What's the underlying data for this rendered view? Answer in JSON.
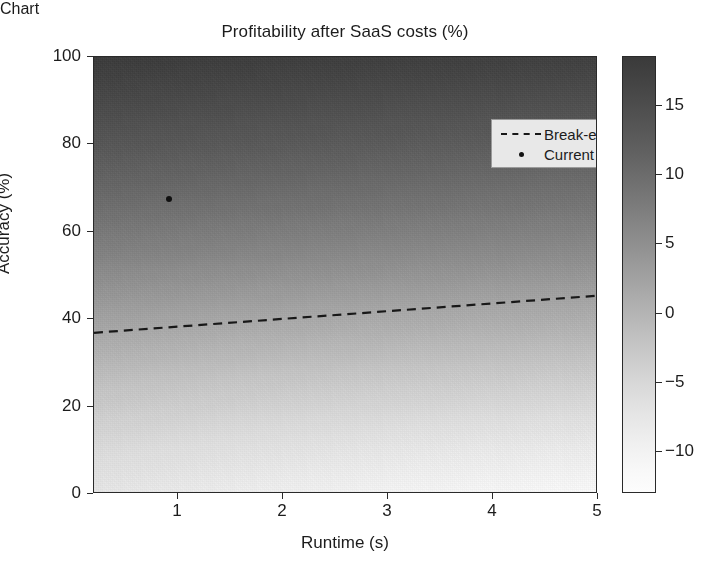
{
  "chart_data": {
    "type": "heatmap",
    "title": "Profitability after SaaS costs (%)",
    "xlabel": "Runtime (s)",
    "ylabel": "Accuracy (%)",
    "xlim": [
      0.2,
      5.0
    ],
    "ylim": [
      0,
      100
    ],
    "grid": false,
    "x_ticks": [
      {
        "value": 1,
        "label": "1"
      },
      {
        "value": 2,
        "label": "2"
      },
      {
        "value": 3,
        "label": "3"
      },
      {
        "value": 4,
        "label": "4"
      },
      {
        "value": 5,
        "label": "5"
      }
    ],
    "y_ticks": [
      {
        "value": 0,
        "label": "0"
      },
      {
        "value": 20,
        "label": "20"
      },
      {
        "value": 40,
        "label": "40"
      },
      {
        "value": 60,
        "label": "60"
      },
      {
        "value": 80,
        "label": "80"
      },
      {
        "value": 100,
        "label": "100"
      }
    ],
    "colorbar": {
      "label": "Profitability after SaaS costs (%)",
      "vmin": -13,
      "vmax": 18.5,
      "orientation": "vertical",
      "position": "right",
      "colormap": "greys_reversed",
      "ticks": [
        {
          "value": 15,
          "label": "15"
        },
        {
          "value": 10,
          "label": "10"
        },
        {
          "value": 5,
          "label": "5"
        },
        {
          "value": 0,
          "label": "0"
        },
        {
          "value": -5,
          "label": "−5"
        },
        {
          "value": -10,
          "label": "−10"
        }
      ]
    },
    "field": {
      "description": "Profitability increases with accuracy and decreases slightly with runtime",
      "corner_values": {
        "top_left": 17.5,
        "top_right": 16.0,
        "bottom_left": -12.0,
        "bottom_right": -13.0
      }
    },
    "series": [
      {
        "name": "Break-even",
        "type": "line",
        "style": "dashed",
        "color": "#181818",
        "x": [
          0.2,
          5.0
        ],
        "y": [
          36.6,
          45.1
        ]
      },
      {
        "name": "Current prototype",
        "type": "scatter",
        "style": "dot",
        "color": "#101010",
        "points": [
          {
            "x": 0.91,
            "y": 67.5
          }
        ]
      }
    ],
    "legend": {
      "position": "upper right",
      "entries": [
        {
          "label": "Break-even",
          "key": "dashed-line"
        },
        {
          "label": "Current prototype",
          "key": "dot-marker"
        }
      ]
    }
  }
}
